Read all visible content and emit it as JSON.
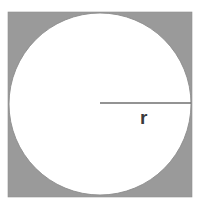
{
  "figure": {
    "labels": {
      "radius": "r"
    },
    "colors": {
      "background": "#ffffff",
      "square_fill": "#9a9a9a",
      "circle_fill": "#ffffff",
      "circle_stroke": "#8c8c8c",
      "radius_line": "#6f6f6f",
      "label_text": "#3a3a3a"
    },
    "geometry": {
      "square": {
        "x": 8,
        "y": 12,
        "width": 184,
        "height": 185
      },
      "circle": {
        "cx": 100,
        "cy": 104,
        "r": 91
      },
      "radius_line": {
        "x1": 100,
        "y1": 103,
        "x2": 191,
        "y2": 103
      },
      "radius_label_position": {
        "x": 140,
        "y": 124
      }
    }
  }
}
